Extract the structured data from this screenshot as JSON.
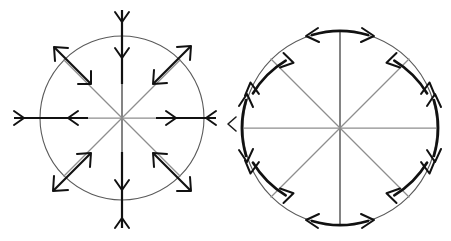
{
  "figure": {
    "background_color": "#ffffff",
    "width": 451,
    "height": 241,
    "panel_count": 2,
    "style": "hand-drawn line art, black ink on white"
  },
  "colors": {
    "ink": "#111111",
    "circle_outline": "#5a5a5a",
    "spoke_gray": "#8e8e8e",
    "spoke_dark": "#5b5b5b",
    "background": "#ffffff"
  },
  "panels": [
    {
      "id": "left-panel",
      "name": "radial-arrows-diagram",
      "label": "Radial (normal) double arrows",
      "circle": {
        "cx": 122,
        "cy": 118,
        "r": 82
      },
      "spoke_count": 8,
      "arrow_type": "double-headed straight, perpendicular to circle",
      "arrow_angles_deg": [
        0,
        45,
        90,
        135,
        180,
        225,
        270,
        315
      ],
      "description": "Eight spokes radiate from the center; on each spoke a heavy double-headed arrow straddles the circle, one head pointing outward and one pointing inward."
    },
    {
      "id": "right-panel",
      "name": "tangential-arrows-diagram",
      "label": "Tangential arc double arrows",
      "circle": {
        "cx": 340,
        "cy": 128,
        "r": 97
      },
      "spoke_count": 8,
      "arrow_type": "double-headed arc, tangent to circle",
      "arrow_angles_deg": [
        0,
        45,
        90,
        135,
        180,
        225,
        270,
        315
      ],
      "arc_half_span_deg": 17,
      "description": "Eight spokes radiate from the center; centered on each spoke endpoint a heavy double-headed arc arrow runs along the circle boundary in both directions."
    }
  ],
  "elements": {
    "left_circle_name": "left-circle-outline",
    "right_circle_name": "right-circle-outline",
    "left_spokes_name": "left-spokes",
    "right_spokes_name": "right-spokes",
    "left_arrows_name": "left-radial-arrows",
    "right_arrows_name": "right-tangential-arrows"
  }
}
